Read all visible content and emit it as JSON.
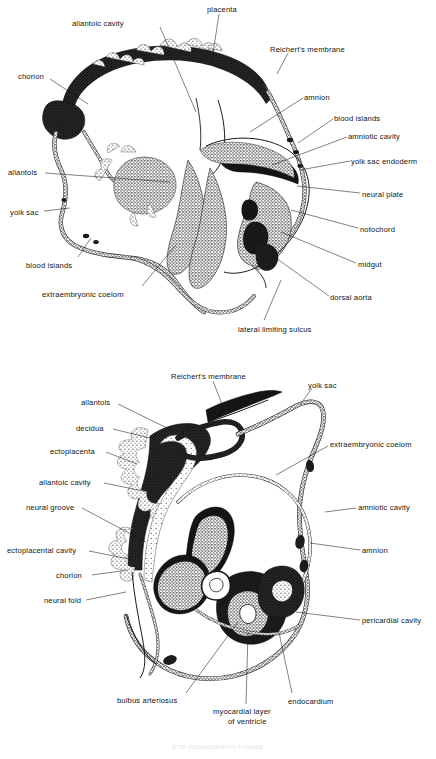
{
  "document": {
    "type": "scientific-illustration",
    "title": "Mouse embryo with extraembryonic membranes — two sagittal sections",
    "background_color": "#ffffff",
    "ink_color": "#1a1a1a",
    "caption": "ETR (MONOGRAPH) FIGURE"
  },
  "figures": [
    {
      "id": "upper",
      "name": "upper-embryo-section",
      "description": "Early somite-stage mouse embryo in situ with placenta, chorion, allantois, yolk sac and amnion",
      "labels": [
        {
          "key": "allantoic_cavity",
          "text": "allantoic cavity",
          "x": 72,
          "y": 19,
          "anchor": "start",
          "leader": [
            [
              160,
              27
            ],
            [
              196,
              112
            ]
          ]
        },
        {
          "key": "placenta",
          "text": "placenta",
          "x": 207,
          "y": 5,
          "anchor": "start",
          "leader": [
            [
              219,
              14
            ],
            [
              212,
              60
            ]
          ]
        },
        {
          "key": "reicherts_membrane",
          "text": "Reichert's membrane",
          "x": 270,
          "y": 45,
          "anchor": "start",
          "leader": [
            [
              288,
              53
            ],
            [
              277,
              74
            ]
          ]
        },
        {
          "key": "chorion",
          "text": "chorion",
          "x": 18,
          "y": 72,
          "anchor": "start",
          "leader": [
            [
              50,
              79
            ],
            [
              88,
              104
            ]
          ]
        },
        {
          "key": "amnion",
          "text": "amnion",
          "x": 304,
          "y": 93,
          "anchor": "start",
          "leader": [
            [
              303,
              98
            ],
            [
              250,
              132
            ]
          ]
        },
        {
          "key": "blood_islands_r",
          "text": "blood islands",
          "x": 334,
          "y": 114,
          "anchor": "start",
          "leader": [
            [
              333,
              119
            ],
            [
              298,
              143
            ]
          ]
        },
        {
          "key": "amniotic_cavity",
          "text": "amniotic cavity",
          "x": 348,
          "y": 132,
          "anchor": "start",
          "leader": [
            [
              347,
              137
            ],
            [
              272,
              165
            ]
          ]
        },
        {
          "key": "yolk_sac_endoderm",
          "text": "yolk sac endoderm",
          "x": 351,
          "y": 157,
          "anchor": "start",
          "leader": [
            [
              350,
              161
            ],
            [
              300,
              170
            ]
          ]
        },
        {
          "key": "neural_plate",
          "text": "neural plate",
          "x": 362,
          "y": 190,
          "anchor": "start",
          "leader": [
            [
              360,
              193
            ],
            [
              297,
              186
            ]
          ]
        },
        {
          "key": "notochord",
          "text": "notochord",
          "x": 360,
          "y": 225,
          "anchor": "start",
          "leader": [
            [
              358,
              228
            ],
            [
              291,
              210
            ]
          ]
        },
        {
          "key": "midgut",
          "text": "midgut",
          "x": 358,
          "y": 260,
          "anchor": "start",
          "leader": [
            [
              356,
              263
            ],
            [
              281,
              232
            ]
          ]
        },
        {
          "key": "dorsal_aorta",
          "text": "dorsal aorta",
          "x": 330,
          "y": 293,
          "anchor": "start",
          "leader": [
            [
              329,
              296
            ],
            [
              276,
              258
            ]
          ]
        },
        {
          "key": "lateral_limiting_sulcus",
          "text": "lateral limiting sulcus",
          "x": 238,
          "y": 325,
          "anchor": "start",
          "leader": [
            [
              264,
              320
            ],
            [
              281,
              280
            ]
          ]
        },
        {
          "key": "allantois",
          "text": "allantois",
          "x": 8,
          "y": 168,
          "anchor": "start",
          "leader": [
            [
              45,
              173
            ],
            [
              170,
              182
            ]
          ]
        },
        {
          "key": "yolk_sac",
          "text": "yolk sac",
          "x": 10,
          "y": 208,
          "anchor": "start",
          "leader": [
            [
              44,
              211
            ],
            [
              70,
              208
            ]
          ]
        },
        {
          "key": "blood_islands_l",
          "text": "blood islands",
          "x": 26,
          "y": 261,
          "anchor": "start",
          "leader": [
            [
              78,
              257
            ],
            [
              91,
              238
            ]
          ]
        },
        {
          "key": "extraembryonic_coelom",
          "text": "extraembryonic coelom",
          "x": 42,
          "y": 290,
          "anchor": "start",
          "leader": [
            [
              142,
              286
            ],
            [
              176,
              245
            ]
          ]
        }
      ]
    },
    {
      "id": "lower",
      "name": "lower-embryo-section",
      "description": "Older mouse embryo in situ showing heart, neural folds, decidua, ectoplacenta and amnion",
      "labels": [
        {
          "key": "reicherts_membrane",
          "text": "Reichert's membrane",
          "x": 171,
          "y": 372,
          "anchor": "start",
          "leader": [
            [
              213,
              381
            ],
            [
              222,
              404
            ]
          ]
        },
        {
          "key": "yolk_sac",
          "text": "yolk sac",
          "x": 308,
          "y": 381,
          "anchor": "start",
          "leader": [
            [
              312,
              388
            ],
            [
              300,
              405
            ]
          ]
        },
        {
          "key": "allantois",
          "text": "allantois",
          "x": 81,
          "y": 398,
          "anchor": "start",
          "leader": [
            [
              118,
              404
            ],
            [
              169,
              429
            ]
          ]
        },
        {
          "key": "decidua",
          "text": "decidua",
          "x": 76,
          "y": 424,
          "anchor": "start",
          "leader": [
            [
              113,
              429
            ],
            [
              158,
              440
            ]
          ]
        },
        {
          "key": "ectoplacenta",
          "text": "ectoplacenta",
          "x": 50,
          "y": 447,
          "anchor": "start",
          "leader": [
            [
              106,
              452
            ],
            [
              137,
              464
            ]
          ]
        },
        {
          "key": "extraembryonic_coelom",
          "text": "extraembryonic coelom",
          "x": 330,
          "y": 440,
          "anchor": "start",
          "leader": [
            [
              328,
              446
            ],
            [
              276,
              475
            ]
          ]
        },
        {
          "key": "allantoic_cavity",
          "text": "allantoic cavity",
          "x": 39,
          "y": 478,
          "anchor": "start",
          "leader": [
            [
              104,
              483
            ],
            [
              148,
              492
            ]
          ]
        },
        {
          "key": "neural_groove",
          "text": "neural groove",
          "x": 26,
          "y": 503,
          "anchor": "start",
          "leader": [
            [
              82,
              508
            ],
            [
              146,
              542
            ]
          ]
        },
        {
          "key": "amniotic_cavity",
          "text": "amniotic cavity",
          "x": 358,
          "y": 503,
          "anchor": "start",
          "leader": [
            [
              356,
              508
            ],
            [
              325,
              512
            ]
          ]
        },
        {
          "key": "ectoplacental_cavity",
          "text": "ectoplacental cavity",
          "x": 7,
          "y": 546,
          "anchor": "start",
          "leader": [
            [
              89,
              551
            ],
            [
              134,
              560
            ]
          ]
        },
        {
          "key": "amnion",
          "text": "amnion",
          "x": 362,
          "y": 546,
          "anchor": "start",
          "leader": [
            [
              360,
              550
            ],
            [
              310,
              543
            ]
          ]
        },
        {
          "key": "chorion",
          "text": "chorion",
          "x": 56,
          "y": 571,
          "anchor": "start",
          "leader": [
            [
              92,
              575
            ],
            [
              128,
              570
            ]
          ]
        },
        {
          "key": "neural_fold",
          "text": "neural fold",
          "x": 44,
          "y": 596,
          "anchor": "start",
          "leader": [
            [
              86,
              600
            ],
            [
              126,
              592
            ]
          ]
        },
        {
          "key": "pericardial_cavity",
          "text": "pericardial cavity",
          "x": 362,
          "y": 616,
          "anchor": "start",
          "leader": [
            [
              360,
              620
            ],
            [
              296,
              612
            ]
          ]
        },
        {
          "key": "bulbus_arteriosus",
          "text": "bulbus arteriosus",
          "x": 117,
          "y": 696,
          "anchor": "start",
          "leader": [
            [
              186,
              693
            ],
            [
              238,
              622
            ]
          ]
        },
        {
          "key": "myocardial_layer",
          "text": "myocardial layer",
          "x": 213,
          "y": 707,
          "anchor": "start",
          "leader": [
            [
              246,
              704
            ],
            [
              248,
              632
            ]
          ]
        },
        {
          "key": "myocardial_layer_2",
          "text": "of ventricle",
          "x": 228,
          "y": 717,
          "anchor": "start",
          "leader": null
        },
        {
          "key": "endocardium",
          "text": "endocardium",
          "x": 288,
          "y": 697,
          "anchor": "start",
          "leader": [
            [
              292,
              693
            ],
            [
              278,
              628
            ]
          ]
        }
      ]
    }
  ]
}
